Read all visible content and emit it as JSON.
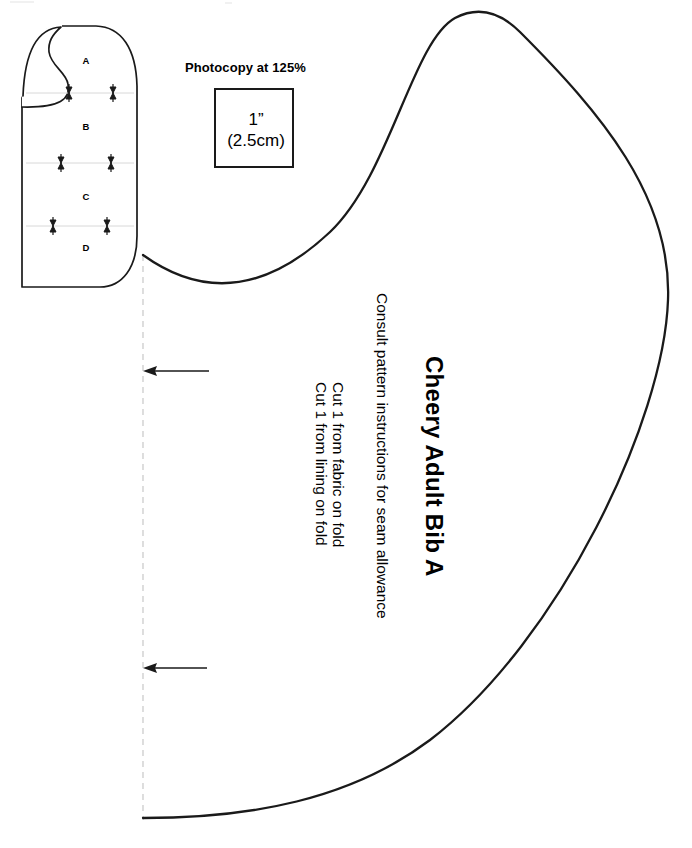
{
  "document": {
    "kind": "sewing-pattern-sheet",
    "sheet_width": 692,
    "sheet_height": 848,
    "background_color": "#ffffff",
    "ink_color": "#1a1a1a",
    "guide_color": "#cccccc"
  },
  "scale_check": {
    "heading": "Photocopy at 125%",
    "box_label_inch": "1”",
    "box_label_metric": "(2.5cm)",
    "box_border_color": "#1a1a1a"
  },
  "mini_pattern": {
    "name": "pattern-placement-thumbnail",
    "section_labels": [
      "A",
      "B",
      "C",
      "D"
    ],
    "sections": [
      {
        "label": "A"
      },
      {
        "label": "B"
      },
      {
        "label": "C"
      },
      {
        "label": "D"
      }
    ],
    "notch_pairs": 3,
    "divider_color": "#d8d8d8"
  },
  "main_piece": {
    "title": "Cheery Adult Bib  A",
    "instruction": "Consult pattern instructions for seam allowance",
    "cut_lines": [
      "Cut 1 from fabric on fold",
      "Cut 1 from lining on fold"
    ],
    "fold_line_label": "place-on-fold",
    "fold_arrows": 2,
    "outline_color": "#1a1a1a",
    "fold_line_color": "#cccccc"
  }
}
